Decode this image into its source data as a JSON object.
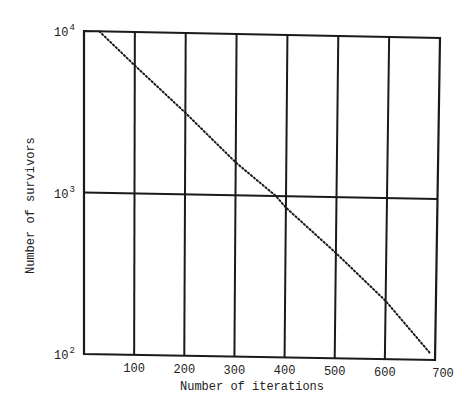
{
  "chart_data": {
    "type": "line",
    "title": "",
    "xlabel": "Number of iterations",
    "ylabel": "Number of survivors",
    "yscale": "log",
    "xlim": [
      0,
      700
    ],
    "ylim": [
      100,
      10000
    ],
    "grid": true,
    "legend": null,
    "x_ticks": [
      "100",
      "200",
      "300",
      "400",
      "500",
      "600",
      "700"
    ],
    "y_ticks": [
      {
        "base": "10",
        "exp": "4",
        "value": 10000
      },
      {
        "base": "10",
        "exp": "3",
        "value": 1000
      },
      {
        "base": "10",
        "exp": "2",
        "value": 100
      }
    ],
    "series": [
      {
        "name": "survivors",
        "style": "dotted",
        "x": [
          30,
          100,
          200,
          300,
          380,
          400,
          500,
          600,
          690
        ],
        "y": [
          10000,
          6200,
          3200,
          1600,
          1000,
          850,
          450,
          230,
          110
        ]
      }
    ]
  }
}
